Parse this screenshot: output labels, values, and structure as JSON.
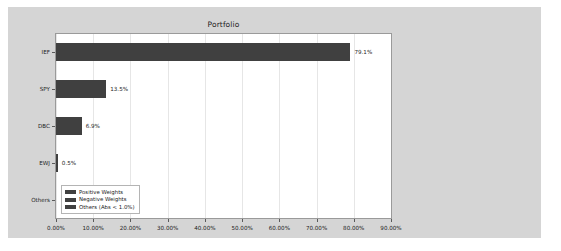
{
  "chart_data": {
    "type": "bar",
    "orientation": "horizontal",
    "title": "Portfolio",
    "xlabel": "",
    "ylabel": "",
    "categories": [
      "IEF",
      "SPY",
      "DBC",
      "EWJ",
      "Others"
    ],
    "values": [
      79.1,
      13.5,
      6.9,
      0.5,
      0.0
    ],
    "value_labels": [
      "79.1%",
      "13.5%",
      "6.9%",
      "0.5%",
      ""
    ],
    "xlim": [
      0,
      90
    ],
    "xticks": [
      0,
      10,
      20,
      30,
      40,
      50,
      60,
      70,
      80,
      90
    ],
    "xtick_labels": [
      "0.00%",
      "10.00%",
      "20.00%",
      "30.00%",
      "40.00%",
      "50.00%",
      "60.00%",
      "70.00%",
      "80.00%",
      "90.00%"
    ],
    "grid": "vertical",
    "legend_position": "lower left",
    "legend": [
      {
        "label": "Positive Weights",
        "color": "#404040"
      },
      {
        "label": "Negative Weights",
        "color": "#404040"
      },
      {
        "label": "Others (Abs < 1.0%)",
        "color": "#404040"
      }
    ],
    "series_color": "#404040",
    "figure_background": "#d5d5d5",
    "axes_background": "#ffffff"
  }
}
